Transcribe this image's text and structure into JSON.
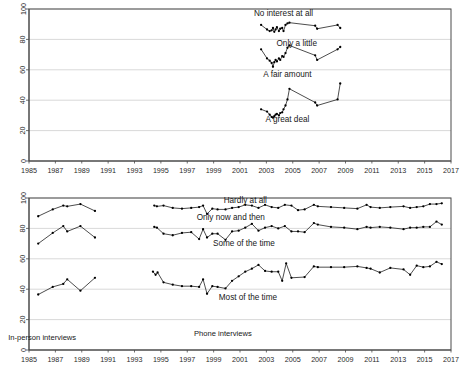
{
  "figure": {
    "background_color": "#ffffff",
    "line_color": "#111111",
    "grid_color": "#c9c9c9",
    "axis_color": "#4a4a4a"
  },
  "chart_data": [
    {
      "type": "line",
      "id": "top-panel",
      "title": "",
      "subtitle": "",
      "xlabel": "",
      "ylabel": "",
      "xlim": [
        1985,
        2017
      ],
      "ylim": [
        0,
        100
      ],
      "grid": true,
      "legend_position": "inline-annotations",
      "xticks": [
        1985,
        1987,
        1989,
        1991,
        1993,
        1995,
        1997,
        1999,
        2001,
        2003,
        2005,
        2007,
        2009,
        2011,
        2013,
        2015,
        2017
      ],
      "xticklabels": [
        "1985",
        "1987",
        "1989",
        "1991",
        "1993",
        "1995",
        "1997",
        "1999",
        "2001",
        "2003",
        "2005",
        "2007",
        "2009",
        "2011",
        "2013",
        "2015",
        "2017"
      ],
      "yticks": [
        0,
        20,
        40,
        60,
        80,
        100
      ],
      "yticklabels": [
        "0",
        "20",
        "40",
        "60",
        "80",
        "100"
      ],
      "annotations": [
        {
          "text": "No interest at all",
          "x": 2004.3,
          "y": 95.5
        },
        {
          "text": "Only a little",
          "x": 2005.3,
          "y": 75.5
        },
        {
          "text": "A fair amount",
          "x": 2004.6,
          "y": 55.0
        },
        {
          "text": "A great deal",
          "x": 2004.6,
          "y": 25.5
        }
      ],
      "series": [
        {
          "name": "No interest at all",
          "x": [
            2002.6,
            2003.05,
            2003.25,
            2003.4,
            2003.5,
            2003.6,
            2003.7,
            2003.8,
            2003.95,
            2004.05,
            2004.2,
            2004.3,
            2004.45,
            2004.6,
            2004.75,
            2006.7,
            2006.85,
            2008.4,
            2008.6
          ],
          "values": [
            89.5,
            86.5,
            85.5,
            86.0,
            87.5,
            85.0,
            86.5,
            88.0,
            85.5,
            87.0,
            87.5,
            85.5,
            89.5,
            90.5,
            91.0,
            89.0,
            87.0,
            89.5,
            87.5
          ]
        },
        {
          "name": "Only a little",
          "x": [
            2002.6,
            2003.05,
            2003.25,
            2003.4,
            2003.5,
            2003.6,
            2003.7,
            2003.8,
            2003.95,
            2004.05,
            2004.2,
            2004.3,
            2004.45,
            2004.6,
            2004.75,
            2006.7,
            2006.85,
            2008.4,
            2008.6
          ],
          "values": [
            73.5,
            67.5,
            66.0,
            64.5,
            62.0,
            65.0,
            66.5,
            65.5,
            67.5,
            66.5,
            69.0,
            68.5,
            71.0,
            74.5,
            76.0,
            69.5,
            66.5,
            73.5,
            75.0
          ]
        },
        {
          "name": "A fair amount / A great deal",
          "x": [
            2002.6,
            2003.05,
            2003.25,
            2003.4,
            2003.5,
            2003.6,
            2003.7,
            2003.8,
            2003.95,
            2004.05,
            2004.2,
            2004.3,
            2004.45,
            2004.6,
            2004.75,
            2006.7,
            2006.85,
            2008.4,
            2008.6
          ],
          "values": [
            34.0,
            32.5,
            30.5,
            29.0,
            28.5,
            29.5,
            30.5,
            31.0,
            30.0,
            31.5,
            32.0,
            34.0,
            36.5,
            40.5,
            47.5,
            38.5,
            36.5,
            40.5,
            51.0
          ]
        }
      ]
    },
    {
      "type": "line",
      "id": "bottom-panel",
      "title": "",
      "subtitle": "",
      "xlabel": "",
      "ylabel": "",
      "xlim": [
        1985,
        2017
      ],
      "ylim": [
        0,
        100
      ],
      "grid": true,
      "legend_position": "inline-annotations",
      "xticks": [
        1985,
        1987,
        1989,
        1991,
        1993,
        1995,
        1997,
        1999,
        2001,
        2003,
        2005,
        2007,
        2009,
        2011,
        2013,
        2015,
        2017
      ],
      "xticklabels": [
        "1985",
        "1987",
        "1989",
        "1991",
        "1993",
        "1995",
        "1997",
        "1999",
        "2001",
        "2003",
        "2005",
        "2007",
        "2009",
        "2011",
        "2013",
        "2015",
        "2017"
      ],
      "yticks": [
        0,
        20,
        40,
        60,
        80,
        100
      ],
      "yticklabels": [
        "0",
        "20",
        "40",
        "60",
        "80",
        "100"
      ],
      "annotations": [
        {
          "text": "Hardly at all",
          "x": 2001.4,
          "y": 96.5
        },
        {
          "text": "Only now and then",
          "x": 2000.3,
          "y": 85.5
        },
        {
          "text": "Some of the time",
          "x": 2001.3,
          "y": 68.5
        },
        {
          "text": "Most of the time",
          "x": 2001.6,
          "y": 33.0
        },
        {
          "text": "In-person interviews",
          "x": 1986.0,
          "y": 6.5
        },
        {
          "text": "Phone interviews",
          "x": 1999.7,
          "y": 9.5
        }
      ],
      "series": [
        {
          "name": "Hardly at all (in-person)",
          "segment": "in-person",
          "x": [
            1985.7,
            1986.8,
            1987.6,
            1987.9,
            1988.9,
            1990.0
          ],
          "values": [
            88.0,
            92.5,
            95.0,
            94.5,
            96.0,
            91.5
          ]
        },
        {
          "name": "Only now and then (in-person)",
          "segment": "in-person",
          "x": [
            1985.7,
            1986.8,
            1987.6,
            1987.9,
            1988.9,
            1990.0
          ],
          "values": [
            70.0,
            77.0,
            81.5,
            78.0,
            81.5,
            74.0
          ]
        },
        {
          "name": "Most of the time (in-person)",
          "segment": "in-person",
          "x": [
            1985.7,
            1986.8,
            1987.6,
            1987.9,
            1988.9,
            1990.0
          ],
          "values": [
            36.5,
            41.5,
            43.5,
            46.5,
            39.0,
            47.5,
            39.5
          ]
        },
        {
          "name": "Hardly at all (phone)",
          "segment": "phone",
          "x": [
            1994.5,
            1994.7,
            1995.2,
            1995.9,
            1996.6,
            1997.3,
            1997.9,
            1998.2,
            1998.5,
            1998.9,
            1999.3,
            1999.9,
            2000.4,
            2000.9,
            2001.4,
            2001.9,
            2002.4,
            2002.9,
            2003.4,
            2003.9,
            2004.4,
            2004.9,
            2005.4,
            2005.9,
            2006.6,
            2006.9,
            2007.9,
            2008.9,
            2009.9,
            2010.6,
            2010.9,
            2011.6,
            2012.4,
            2013.4,
            2013.9,
            2014.4,
            2014.9,
            2015.4,
            2015.9,
            2016.3
          ],
          "values": [
            95.0,
            94.5,
            95.0,
            93.5,
            93.0,
            93.5,
            94.0,
            95.0,
            89.5,
            93.0,
            92.5,
            92.5,
            93.5,
            94.0,
            95.5,
            95.0,
            93.5,
            95.5,
            94.0,
            93.5,
            95.5,
            95.0,
            92.0,
            92.5,
            95.5,
            94.5,
            94.0,
            93.5,
            93.0,
            95.5,
            94.0,
            93.5,
            94.0,
            94.5,
            93.5,
            94.0,
            94.5,
            96.0,
            96.0,
            96.5
          ]
        },
        {
          "name": "Only now and then (phone)",
          "segment": "phone",
          "x": [
            1994.5,
            1994.7,
            1995.2,
            1995.9,
            1996.6,
            1997.3,
            1997.9,
            1998.2,
            1998.5,
            1998.9,
            1999.3,
            1999.9,
            2000.4,
            2000.9,
            2001.4,
            2001.9,
            2002.4,
            2002.9,
            2003.4,
            2003.9,
            2004.4,
            2004.9,
            2005.4,
            2005.9,
            2006.6,
            2006.9,
            2007.9,
            2008.9,
            2009.9,
            2010.6,
            2010.9,
            2011.6,
            2012.4,
            2013.4,
            2013.9,
            2014.4,
            2014.9,
            2015.4,
            2015.9,
            2016.3
          ],
          "values": [
            81.0,
            80.5,
            76.5,
            75.5,
            77.0,
            77.5,
            73.0,
            79.5,
            74.0,
            76.5,
            76.5,
            72.5,
            78.0,
            78.5,
            80.5,
            83.0,
            78.5,
            80.5,
            81.5,
            80.0,
            81.5,
            78.0,
            78.0,
            77.5,
            83.5,
            82.5,
            81.0,
            80.5,
            79.5,
            81.0,
            80.5,
            81.0,
            80.5,
            79.5,
            80.5,
            80.5,
            81.0,
            81.0,
            84.5,
            82.5
          ]
        },
        {
          "name": "Most of the time (phone)",
          "segment": "phone",
          "x": [
            1994.4,
            1994.6,
            1994.75,
            1995.2,
            1995.9,
            1996.6,
            1997.3,
            1997.9,
            1998.2,
            1998.5,
            1998.9,
            1999.3,
            1999.9,
            2000.4,
            2000.9,
            2001.4,
            2001.9,
            2002.4,
            2002.9,
            2003.4,
            2003.9,
            2004.2,
            2004.5,
            2004.9,
            2005.9,
            2006.6,
            2006.9,
            2007.9,
            2008.9,
            2009.9,
            2010.6,
            2010.9,
            2011.6,
            2012.4,
            2013.4,
            2013.9,
            2014.4,
            2014.9,
            2015.4,
            2015.9,
            2016.3
          ],
          "values": [
            51.5,
            49.5,
            51.0,
            44.5,
            43.0,
            42.0,
            42.0,
            41.5,
            46.5,
            37.0,
            42.0,
            41.5,
            40.5,
            45.5,
            48.5,
            51.5,
            53.5,
            56.0,
            52.0,
            51.5,
            51.5,
            45.5,
            57.0,
            47.5,
            48.0,
            55.0,
            54.5,
            54.5,
            54.5,
            55.0,
            54.0,
            53.5,
            51.0,
            54.0,
            53.0,
            49.5,
            55.5,
            54.5,
            55.0,
            58.0,
            56.5
          ]
        }
      ]
    }
  ]
}
